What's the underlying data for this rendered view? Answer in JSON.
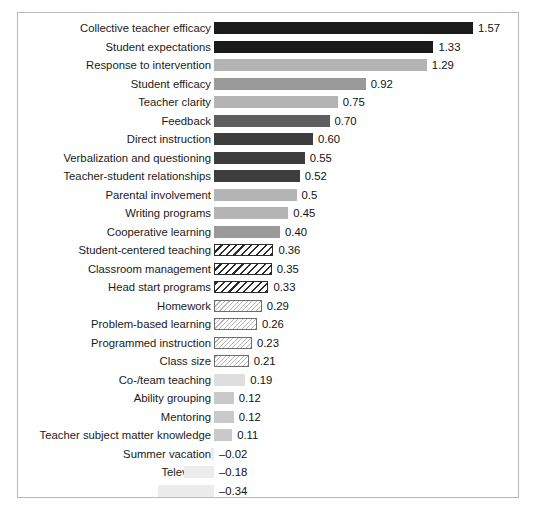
{
  "figure": {
    "clipped_caption": "",
    "frame_color": "#b9b9b9",
    "baseline_label": "0"
  },
  "chart_data": {
    "type": "bar",
    "orientation": "horizontal",
    "title": "",
    "subtitle": "",
    "xlabel": "",
    "ylabel": "",
    "grid": false,
    "legend": "none",
    "axis_visible": false,
    "value_labels_shown": true,
    "xlim": [
      -0.34,
      1.57
    ],
    "zero_baseline": 0,
    "px_per_unit": 165,
    "categories": [
      "Collective teacher efficacy",
      "Student expectations",
      "Response to intervention",
      "Student efficacy",
      "Teacher clarity",
      "Feedback",
      "Direct instruction",
      "Verbalization and questioning",
      "Teacher-student relationships",
      "Parental involvement",
      "Writing programs",
      "Cooperative learning",
      "Student-centered teaching",
      "Classroom management",
      "Head start programs",
      "Homework",
      "Problem-based learning",
      "Programmed instruction",
      "Class size",
      "Co-/team teaching",
      "Ability grouping",
      "Mentoring",
      "Teacher subject matter knowledge",
      "Summer vacation",
      "Television",
      "Mobility"
    ],
    "values": [
      1.57,
      1.33,
      1.29,
      0.92,
      0.75,
      0.7,
      0.6,
      0.55,
      0.52,
      0.5,
      0.45,
      0.4,
      0.36,
      0.35,
      0.33,
      0.29,
      0.26,
      0.23,
      0.21,
      0.19,
      0.12,
      0.12,
      0.11,
      -0.02,
      -0.18,
      -0.34
    ],
    "value_labels": [
      "1.57",
      "1.33",
      "1.29",
      "0.92",
      "0.75",
      "0.70",
      "0.60",
      "0.55",
      "0.52",
      "0.5",
      "0.45",
      "0.40",
      "0.36",
      "0.35",
      "0.33",
      "0.29",
      "0.26",
      "0.23",
      "0.21",
      "0.19",
      "0.12",
      "0.12",
      "0.11",
      "–0.02",
      "–0.18",
      "–0.34"
    ],
    "bar_styles": [
      "s-black",
      "s-black",
      "s-lightgray",
      "s-gray",
      "s-lightgray",
      "s-mid",
      "s-dark",
      "s-dark",
      "s-dark",
      "s-lightgray",
      "s-lightgray",
      "s-gray",
      "s-hatch-bold",
      "s-hatch-bold",
      "s-hatch-bold",
      "s-hatch-fine",
      "s-hatch-fine",
      "s-hatch-fine",
      "s-hatch-fine",
      "s-faint",
      "s-pale",
      "s-pale",
      "s-pale",
      "s-ghost",
      "s-ghost",
      "s-ghost"
    ]
  }
}
